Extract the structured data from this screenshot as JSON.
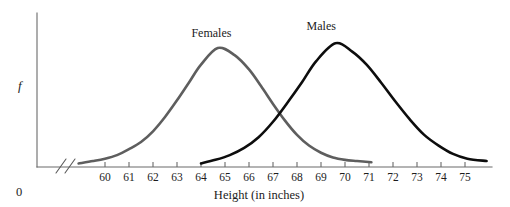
{
  "chart_data": {
    "type": "line",
    "title": "",
    "xlabel": "Height (in inches)",
    "ylabel": "f",
    "origin_label": "0",
    "axis_break": true,
    "grid": false,
    "legend_position": "inline-annotation",
    "xlim": [
      59.2,
      76.0
    ],
    "xticks": [
      60,
      61,
      62,
      63,
      64,
      65,
      66,
      67,
      68,
      69,
      70,
      71,
      72,
      73,
      74,
      75
    ],
    "xtick_labels": [
      "60",
      "61",
      "62",
      "63",
      "64",
      "65",
      "66",
      "67",
      "68",
      "69",
      "70",
      "71",
      "72",
      "73",
      "74",
      "75"
    ],
    "ylim": [
      0,
      1.08
    ],
    "yticks": [],
    "series": [
      {
        "name": "Females",
        "label": "Females",
        "color": "#5e5e5e",
        "mean": 64.7,
        "sd": 2.0,
        "peak_x": 64.7,
        "peak_y": 1.0,
        "x_start": 58.9,
        "x_end": 71.1,
        "x": [
          58.9,
          59.5,
          60.0,
          60.5,
          61.0,
          61.5,
          62.0,
          62.5,
          63.0,
          63.5,
          64.0,
          64.7,
          65.4,
          66.0,
          66.5,
          67.0,
          67.5,
          68.0,
          68.5,
          69.0,
          69.5,
          70.0,
          70.5,
          71.1
        ],
        "y": [
          0.03,
          0.05,
          0.07,
          0.1,
          0.15,
          0.21,
          0.3,
          0.42,
          0.56,
          0.71,
          0.86,
          1.0,
          0.94,
          0.82,
          0.68,
          0.53,
          0.39,
          0.27,
          0.18,
          0.12,
          0.08,
          0.06,
          0.05,
          0.04
        ]
      },
      {
        "name": "Males",
        "label": "Males",
        "color": "#0d0d0d",
        "mean": 69.6,
        "sd": 2.1,
        "peak_x": 69.6,
        "peak_y": 1.04,
        "x_start": 64.0,
        "x_end": 75.9,
        "x": [
          64.0,
          64.6,
          65.2,
          65.8,
          66.4,
          67.0,
          67.6,
          68.2,
          68.8,
          69.6,
          70.3,
          70.9,
          71.5,
          72.1,
          72.7,
          73.3,
          73.9,
          74.5,
          75.1,
          75.9
        ],
        "y": [
          0.03,
          0.06,
          0.1,
          0.16,
          0.25,
          0.38,
          0.54,
          0.71,
          0.89,
          1.04,
          0.97,
          0.86,
          0.71,
          0.55,
          0.4,
          0.27,
          0.18,
          0.11,
          0.07,
          0.05
        ]
      }
    ],
    "annotations": [
      {
        "text": "Females",
        "x": 64.6,
        "y": 1.12
      },
      {
        "text": "Males",
        "x": 69.4,
        "y": 1.18
      }
    ],
    "intersection": {
      "x": 67.2,
      "y": 0.46
    }
  }
}
